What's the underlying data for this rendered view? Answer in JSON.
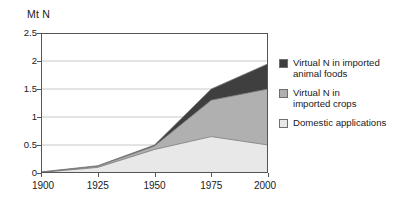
{
  "chart_data": {
    "type": "area",
    "stacked": true,
    "title": "",
    "subtitle": "",
    "xlabel": "",
    "ylabel": "Mt N",
    "unit_caption": "Mt N",
    "x": [
      1900,
      1925,
      1950,
      1975,
      2000
    ],
    "categories": [
      "1900",
      "1925",
      "1950",
      "1975",
      "2000"
    ],
    "xticklabels": [
      "1900",
      "1925",
      "1950",
      "1975",
      "2000"
    ],
    "yticklabels": [
      "0",
      "0.5",
      "1",
      "1.5",
      "2",
      "2.5"
    ],
    "ytickvalues": [
      0,
      0.5,
      1,
      1.5,
      2,
      2.5
    ],
    "xlim": [
      1900,
      2000
    ],
    "ylim": [
      0,
      2.5
    ],
    "grid": "horizontal",
    "legend_position": "right",
    "series": [
      {
        "name": "Domestic applications",
        "color": "#e8e8e8",
        "values": [
          0.01,
          0.1,
          0.42,
          0.65,
          0.5
        ],
        "stack_order": 1
      },
      {
        "name": "Virtual N in imported crops",
        "color": "#b0b0b0",
        "values": [
          0.005,
          0.02,
          0.06,
          0.65,
          1.0
        ],
        "stack_order": 2
      },
      {
        "name": "Virtual N in imported animal foods",
        "color": "#3f3f3f",
        "values": [
          0.005,
          0.01,
          0.02,
          0.2,
          0.45
        ],
        "stack_order": 3
      }
    ],
    "cumulative_tops": {
      "domestic_applications": [
        0.01,
        0.1,
        0.42,
        0.65,
        0.5
      ],
      "plus_imported_crops": [
        0.015,
        0.12,
        0.48,
        1.3,
        1.5
      ],
      "plus_imported_animal_foods": [
        0.02,
        0.13,
        0.5,
        1.5,
        1.95
      ]
    }
  },
  "legend": {
    "items": [
      {
        "label_line1": "Virtual N in imported",
        "label_line2": "animal foods",
        "color": "#3f3f3f"
      },
      {
        "label_line1": "Virtual N in",
        "label_line2": "imported crops",
        "color": "#b0b0b0"
      },
      {
        "label_line1": "Domestic applications",
        "label_line2": "",
        "color": "#e8e8e8"
      }
    ]
  },
  "axes": {
    "unit": "Mt N",
    "y_ticks": [
      "2.5",
      "2",
      "1.5",
      "1",
      "0.5",
      "0"
    ],
    "x_ticks": [
      "1900",
      "1925",
      "1950",
      "1975",
      "2000"
    ]
  },
  "colors": {
    "axis": "#555555",
    "grid": "#c8c8c8",
    "text": "#1a1a1a",
    "series_dark": "#3f3f3f",
    "series_mid": "#b0b0b0",
    "series_light": "#e8e8e8"
  }
}
